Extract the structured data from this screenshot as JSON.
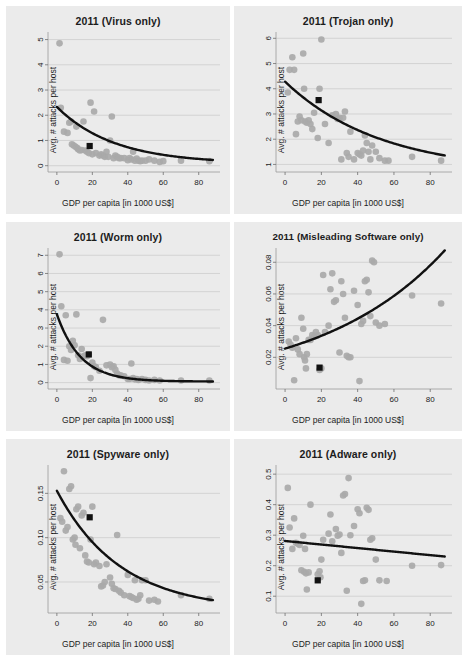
{
  "figure": {
    "background": "#ebebeb",
    "point_color": "#a9a9a9",
    "trend_color": "#111111",
    "marker_color": "#111111",
    "grid_color": "#c9c9c9",
    "xlabel": "GDP per capita [in 1000 US$]",
    "ylabel": "Avg. # attacks per host",
    "xticks": [
      0,
      20,
      40,
      60,
      80
    ],
    "xlim": [
      -5,
      92
    ]
  },
  "chart_data": [
    {
      "type": "scatter",
      "title": "2011 (Virus only)",
      "xlabel": "GDP per capita [in 1000 US$]",
      "ylabel": "Avg. # attacks per host",
      "xlim": [
        -5,
        92
      ],
      "ylim": [
        -0.25,
        5.3
      ],
      "xticks": [
        0,
        20,
        40,
        60,
        80
      ],
      "yticks": [
        0,
        1,
        2,
        3,
        4,
        5
      ],
      "ytick_labels": [
        "0",
        "1",
        "2",
        "3",
        "4",
        "5"
      ],
      "grid": true,
      "legend": "none",
      "trend": {
        "kind": "exponential-decay",
        "a": 2.25,
        "b": 0.031,
        "c": 0.08
      },
      "highlight": {
        "x": 18.5,
        "y": 0.78,
        "shape": "square",
        "color": "#111111"
      },
      "x": [
        1.5,
        2.2,
        4.0,
        6.0,
        7.0,
        8.0,
        8.5,
        9.5,
        10.5,
        11.0,
        11.5,
        12.0,
        13.0,
        14.0,
        15.0,
        16.0,
        17.0,
        18.0,
        19.0,
        20.0,
        21.0,
        22.0,
        24.0,
        25.0,
        26.0,
        27.0,
        28.0,
        29.0,
        30.0,
        31.0,
        32.0,
        33.0,
        34.0,
        35.0,
        36.0,
        38.0,
        40.0,
        41.0,
        42.0,
        43.0,
        44.0,
        45.0,
        46.0,
        47.0,
        48.0,
        50.0,
        52.0,
        55.0,
        58.0,
        60.0,
        70.0,
        86.0
      ],
      "y": [
        4.85,
        2.3,
        1.35,
        1.3,
        1.7,
        1.75,
        0.85,
        0.8,
        0.75,
        1.55,
        0.7,
        0.65,
        0.6,
        0.62,
        1.75,
        0.6,
        0.55,
        0.5,
        2.5,
        0.45,
        2.15,
        0.5,
        0.4,
        0.45,
        0.4,
        0.35,
        0.55,
        0.35,
        1.0,
        1.95,
        0.3,
        0.4,
        0.35,
        0.3,
        0.3,
        0.3,
        0.22,
        0.3,
        0.25,
        0.55,
        0.2,
        0.28,
        0.2,
        0.18,
        0.2,
        0.2,
        0.25,
        0.2,
        0.15,
        0.18,
        0.2,
        0.18
      ]
    },
    {
      "type": "scatter",
      "title": "2011 (Trojan only)",
      "xlabel": "GDP per capita [in 1000 US$]",
      "ylabel": "Avg. # attacks per host",
      "xlim": [
        -5,
        92
      ],
      "ylim": [
        0.7,
        6.25
      ],
      "xticks": [
        0,
        20,
        40,
        60,
        80
      ],
      "yticks": [
        1,
        2,
        3,
        4,
        5,
        6
      ],
      "ytick_labels": [
        "1",
        "2",
        "3",
        "4",
        "5",
        "6"
      ],
      "grid": true,
      "legend": "none",
      "trend": {
        "kind": "exponential-decay",
        "a": 3.6,
        "b": 0.019,
        "c": 0.68
      },
      "highlight": {
        "x": 18.5,
        "y": 3.55,
        "shape": "square",
        "color": "#111111"
      },
      "x": [
        1.5,
        2.5,
        4.0,
        5.0,
        6.0,
        7.0,
        8.0,
        9.0,
        10.0,
        10.5,
        11.0,
        12.0,
        13.0,
        14.0,
        15.0,
        16.0,
        18.0,
        19.0,
        20.0,
        22.0,
        24.0,
        26.0,
        28.0,
        29.0,
        30.0,
        31.0,
        32.0,
        33.0,
        34.0,
        35.0,
        36.0,
        38.0,
        40.0,
        41.0,
        42.0,
        43.0,
        44.0,
        45.0,
        46.0,
        47.0,
        48.0,
        50.0,
        52.0,
        55.0,
        57.0,
        70.0,
        86.0
      ],
      "y": [
        3.85,
        4.75,
        5.25,
        4.75,
        2.2,
        2.7,
        2.9,
        2.75,
        5.4,
        4.0,
        2.7,
        2.65,
        2.75,
        2.6,
        2.4,
        3.05,
        2.05,
        4.0,
        5.95,
        2.6,
        1.85,
        2.95,
        3.0,
        2.8,
        2.85,
        1.2,
        2.85,
        3.1,
        1.45,
        1.3,
        2.3,
        1.2,
        1.45,
        1.4,
        1.35,
        1.55,
        2.15,
        1.85,
        1.5,
        1.2,
        1.75,
        1.5,
        1.25,
        1.15,
        1.15,
        1.3,
        1.15
      ]
    },
    {
      "type": "scatter",
      "title": "2011 (Worm only)",
      "xlabel": "GDP per capita [in 1000 US$]",
      "ylabel": "Avg. # attacks per host",
      "xlim": [
        -5,
        92
      ],
      "ylim": [
        -0.35,
        7.4
      ],
      "xticks": [
        0,
        20,
        40,
        60,
        80
      ],
      "yticks": [
        0,
        1,
        2,
        3,
        4,
        5,
        6,
        7
      ],
      "ytick_labels": [
        "0",
        "1",
        "2",
        "3",
        "4",
        "5",
        "6",
        "7"
      ],
      "grid": true,
      "legend": "none",
      "trend": {
        "kind": "exponential-decay",
        "a": 3.7,
        "b": 0.075,
        "c": 0.06
      },
      "highlight": {
        "x": 18.0,
        "y": 1.55,
        "shape": "square",
        "color": "#111111"
      },
      "x": [
        1.5,
        2.5,
        4.0,
        5.0,
        6.0,
        7.0,
        8.0,
        9.0,
        10.0,
        11.0,
        12.0,
        13.0,
        14.0,
        15.0,
        16.0,
        17.0,
        18.0,
        19.0,
        20.0,
        21.0,
        22.0,
        24.0,
        26.0,
        28.0,
        30.0,
        31.0,
        32.0,
        33.0,
        34.0,
        35.0,
        36.0,
        38.0,
        40.0,
        41.0,
        42.0,
        43.0,
        44.0,
        45.0,
        46.0,
        48.0,
        50.0,
        52.0,
        55.0,
        58.0,
        70.0,
        86.0
      ],
      "y": [
        7.05,
        4.2,
        1.25,
        3.7,
        1.2,
        2.0,
        1.8,
        2.3,
        2.05,
        3.75,
        1.5,
        1.3,
        1.85,
        1.45,
        1.5,
        1.45,
        1.55,
        0.25,
        1.1,
        0.9,
        0.85,
        0.65,
        3.45,
        0.95,
        1.0,
        0.85,
        0.9,
        0.7,
        0.5,
        0.4,
        0.4,
        0.35,
        0.2,
        0.2,
        1.05,
        0.25,
        0.18,
        0.2,
        0.15,
        0.2,
        0.15,
        0.12,
        0.15,
        0.12,
        0.12,
        0.12
      ]
    },
    {
      "type": "scatter",
      "title": "2011 (Misleading Software only)",
      "xlabel": "GDP per capita [in 1000 US$]",
      "ylabel": "Avg. # attacks per host",
      "xlim": [
        -5,
        92
      ],
      "ylim": [
        0.0,
        0.089
      ],
      "xticks": [
        0,
        20,
        40,
        60,
        80
      ],
      "yticks": [
        0.02,
        0.04,
        0.06,
        0.08
      ],
      "ytick_labels": [
        "0.02",
        "0.04",
        "0.06",
        "0.08"
      ],
      "grid": true,
      "legend": "none",
      "trend": {
        "kind": "exponential-growth",
        "a": 0.024,
        "b": 0.0145,
        "c": 0.0015
      },
      "highlight": {
        "x": 19.0,
        "y": 0.0135,
        "shape": "square",
        "color": "#111111"
      },
      "x": [
        2.0,
        3.0,
        4.0,
        5.0,
        6.0,
        7.0,
        8.0,
        9.0,
        10.0,
        10.5,
        11.0,
        11.5,
        12.0,
        13.0,
        14.0,
        15.0,
        16.0,
        17.0,
        18.0,
        19.0,
        20.0,
        21.0,
        22.0,
        24.0,
        25.0,
        26.0,
        27.0,
        28.0,
        30.0,
        31.0,
        32.0,
        33.0,
        34.0,
        35.0,
        36.0,
        38.0,
        40.0,
        41.0,
        42.0,
        43.0,
        44.0,
        45.0,
        46.0,
        47.0,
        48.0,
        49.0,
        50.0,
        52.0,
        55.0,
        70.0,
        86.0
      ],
      "y": [
        0.03,
        0.028,
        0.026,
        0.0055,
        0.032,
        0.025,
        0.022,
        0.045,
        0.038,
        0.02,
        0.018,
        0.013,
        0.022,
        0.031,
        0.031,
        0.034,
        0.033,
        0.036,
        0.034,
        0.012,
        0.013,
        0.072,
        0.036,
        0.04,
        0.063,
        0.073,
        0.055,
        0.056,
        0.023,
        0.068,
        0.06,
        0.045,
        0.021,
        0.02,
        0.02,
        0.062,
        0.053,
        0.005,
        0.041,
        0.043,
        0.068,
        0.069,
        0.061,
        0.046,
        0.081,
        0.08,
        0.042,
        0.04,
        0.041,
        0.059,
        0.054
      ]
    },
    {
      "type": "scatter",
      "title": "2011 (Spyware only)",
      "xlabel": "GDP per capita [in 1000 US$]",
      "ylabel": "Avg. # attacks per host",
      "xlim": [
        -5,
        92
      ],
      "ylim": [
        0.015,
        0.182
      ],
      "xticks": [
        0,
        20,
        40,
        60,
        80
      ],
      "yticks": [
        0.05,
        0.1,
        0.15
      ],
      "ytick_labels": [
        "0.05",
        "0.10",
        "0.15"
      ],
      "grid": true,
      "legend": "none",
      "trend": {
        "kind": "exponential-decay",
        "a": 0.135,
        "b": 0.028,
        "c": 0.018
      },
      "highlight": {
        "x": 18.5,
        "y": 0.123,
        "shape": "square",
        "color": "#111111"
      },
      "x": [
        2.0,
        3.0,
        4.0,
        5.0,
        6.0,
        7.0,
        8.0,
        9.0,
        10.0,
        10.5,
        11.0,
        12.0,
        13.0,
        14.0,
        15.0,
        16.0,
        17.0,
        18.0,
        19.0,
        20.0,
        21.0,
        22.0,
        24.0,
        25.0,
        26.0,
        27.0,
        28.0,
        30.0,
        31.0,
        32.0,
        33.0,
        34.0,
        35.0,
        36.0,
        38.0,
        40.0,
        41.0,
        42.0,
        43.0,
        44.0,
        45.0,
        46.0,
        47.0,
        48.0,
        50.0,
        52.0,
        55.0,
        57.0,
        70.0,
        86.0
      ],
      "y": [
        0.122,
        0.118,
        0.175,
        0.108,
        0.112,
        0.155,
        0.158,
        0.098,
        0.1,
        0.092,
        0.132,
        0.135,
        0.088,
        0.125,
        0.128,
        0.08,
        0.073,
        0.072,
        0.098,
        0.135,
        0.07,
        0.072,
        0.068,
        0.045,
        0.046,
        0.05,
        0.07,
        0.055,
        0.048,
        0.043,
        0.042,
        0.103,
        0.04,
        0.038,
        0.035,
        0.058,
        0.034,
        0.033,
        0.032,
        0.052,
        0.03,
        0.031,
        0.035,
        0.052,
        0.052,
        0.029,
        0.03,
        0.028,
        0.035,
        0.031
      ]
    },
    {
      "type": "scatter",
      "title": "2011 (Adware only)",
      "xlabel": "GDP per capita [in 1000 US$]",
      "ylabel": "Avg. # attacks per host",
      "xlim": [
        -5,
        92
      ],
      "ylim": [
        0.045,
        0.53
      ],
      "xticks": [
        0,
        20,
        40,
        60,
        80
      ],
      "yticks": [
        0.1,
        0.2,
        0.3,
        0.4,
        0.5
      ],
      "ytick_labels": [
        "0.1",
        "0.2",
        "0.3",
        "0.4",
        "0.5"
      ],
      "grid": true,
      "legend": "none",
      "trend": {
        "kind": "linear",
        "intercept": 0.281,
        "slope": -0.00058
      },
      "highlight": {
        "x": 18.0,
        "y": 0.152,
        "shape": "square",
        "color": "#111111"
      },
      "x": [
        1.5,
        2.5,
        4.0,
        5.0,
        6.0,
        7.0,
        8.0,
        9.0,
        10.0,
        10.5,
        11.0,
        11.5,
        12.0,
        13.0,
        14.0,
        18.0,
        19.0,
        19.5,
        20.0,
        21.0,
        24.0,
        25.0,
        26.0,
        28.0,
        29.0,
        30.0,
        31.0,
        32.0,
        33.0,
        34.0,
        35.0,
        36.0,
        38.0,
        40.0,
        41.0,
        42.0,
        43.0,
        44.0,
        45.0,
        46.0,
        47.0,
        48.0,
        50.0,
        52.0,
        56.0,
        70.0,
        86.0
      ],
      "y": [
        0.455,
        0.325,
        0.255,
        0.355,
        0.275,
        0.272,
        0.268,
        0.185,
        0.298,
        0.18,
        0.255,
        0.175,
        0.122,
        0.178,
        0.4,
        0.172,
        0.182,
        0.162,
        0.22,
        0.285,
        0.305,
        0.368,
        0.28,
        0.32,
        0.298,
        0.302,
        0.242,
        0.43,
        0.435,
        0.118,
        0.487,
        0.3,
        0.33,
        0.385,
        0.372,
        0.075,
        0.15,
        0.152,
        0.39,
        0.383,
        0.285,
        0.29,
        0.22,
        0.152,
        0.15,
        0.2,
        0.202
      ]
    }
  ]
}
